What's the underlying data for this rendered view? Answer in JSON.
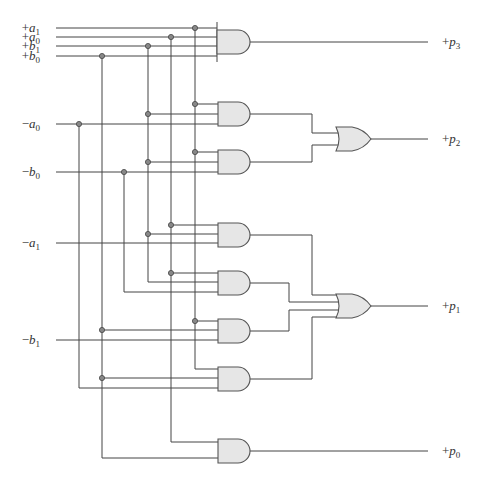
{
  "inputs": [
    {
      "id": "pa1",
      "sign": "+",
      "var": "a",
      "sub": "1",
      "y": 28
    },
    {
      "id": "pa0",
      "sign": "+",
      "var": "a",
      "sub": "0",
      "y": 37
    },
    {
      "id": "pb1",
      "sign": "+",
      "var": "b",
      "sub": "1",
      "y": 46
    },
    {
      "id": "pb0",
      "sign": "+",
      "var": "b",
      "sub": "0",
      "y": 56
    },
    {
      "id": "na0",
      "sign": "−",
      "var": "a",
      "sub": "0",
      "y": 124
    },
    {
      "id": "nb0",
      "sign": "−",
      "var": "b",
      "sub": "0",
      "y": 172
    },
    {
      "id": "na1",
      "sign": "−",
      "var": "a",
      "sub": "1",
      "y": 243
    },
    {
      "id": "nb1",
      "sign": "−",
      "var": "b",
      "sub": "1",
      "y": 340
    }
  ],
  "outputs": [
    {
      "id": "p3",
      "sign": "+",
      "var": "p",
      "sub": "3",
      "y": 42
    },
    {
      "id": "p2",
      "sign": "+",
      "var": "p",
      "sub": "2",
      "y": 139
    },
    {
      "id": "p1",
      "sign": "+",
      "var": "p",
      "sub": "1",
      "y": 306
    },
    {
      "id": "p0",
      "sign": "+",
      "var": "p",
      "sub": "0",
      "y": 451
    }
  ],
  "gates": {
    "and_count": 8,
    "or_count": 2,
    "colors": {
      "fill": "#e6e6e6",
      "stroke": "#555555",
      "wire": "#444444",
      "junction": "#888888"
    }
  }
}
